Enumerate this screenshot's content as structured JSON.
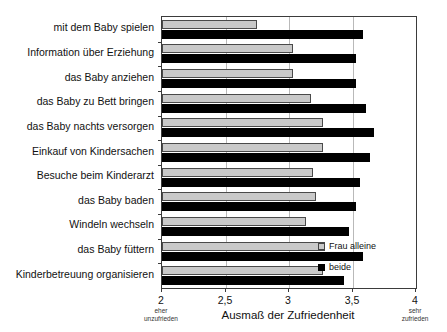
{
  "chart_data": {
    "type": "bar",
    "orientation": "horizontal",
    "title": "",
    "xlabel": "Ausmaß der Zufriedenheit",
    "ylabel": "",
    "xlim": [
      2,
      4
    ],
    "xticks": [
      "2",
      "2,5",
      "3",
      "3,5",
      "4"
    ],
    "xtick_values": [
      2,
      2.5,
      3,
      3.5,
      4
    ],
    "grid": true,
    "legend_position": "right-bottom-inside",
    "axis_annotations": {
      "left": "eher unzufrieden",
      "left_line1": "eher",
      "left_line2": "unzufrieden",
      "right": "sehr zufrieden",
      "right_line1": "sehr",
      "right_line2": "zufrieden"
    },
    "categories": [
      "mit dem Baby spielen",
      "Information über Erziehung",
      "das Baby anziehen",
      "das Baby zu Bett bringen",
      "das Baby nachts versorgen",
      "Einkauf von Kindersachen",
      "Besuche beim Kinderarzt",
      "das Baby baden",
      "Windeln wechseln",
      "das Baby füttern",
      "Kinderbetreuung organisieren"
    ],
    "series": [
      {
        "name": "Frau alleine",
        "color": "#c9c9c9",
        "values": [
          2.75,
          3.03,
          3.03,
          3.17,
          3.27,
          3.27,
          3.19,
          3.21,
          3.13,
          3.28,
          3.27
        ]
      },
      {
        "name": "beide",
        "color": "#000000",
        "values": [
          3.58,
          3.53,
          3.53,
          3.61,
          3.67,
          3.64,
          3.56,
          3.53,
          3.47,
          3.58,
          3.43
        ]
      }
    ]
  },
  "legend": {
    "items": [
      {
        "label": "Frau alleine",
        "swatch": "gray"
      },
      {
        "label": "beide",
        "swatch": "black"
      }
    ]
  }
}
